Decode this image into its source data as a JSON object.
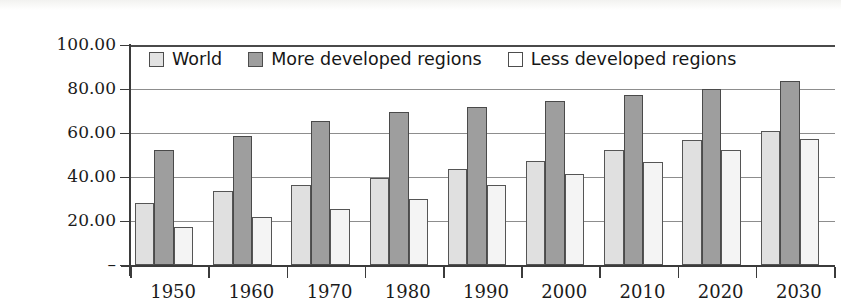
{
  "chart_data": {
    "type": "bar",
    "title": "",
    "xlabel": "",
    "ylabel": "",
    "grid": true,
    "legend_position": "top-inside",
    "ylim": [
      0,
      100
    ],
    "yticks": [
      0,
      20,
      40,
      60,
      80,
      100
    ],
    "ytick_labels": [
      "–",
      "20.00",
      "40.00",
      "60.00",
      "80.00",
      "100.00"
    ],
    "categories": [
      "1950",
      "1960",
      "1970",
      "1980",
      "1990",
      "2000",
      "2010",
      "2020",
      "2030"
    ],
    "series": [
      {
        "name": "World",
        "color": "#e0e0e0",
        "values": [
          28.0,
          33.5,
          36.5,
          39.5,
          43.5,
          47.5,
          52.5,
          57.0,
          61.0
        ]
      },
      {
        "name": "More developed regions",
        "color": "#9e9e9e",
        "values": [
          52.5,
          58.5,
          65.5,
          69.5,
          72.0,
          74.5,
          77.5,
          80.0,
          83.5
        ]
      },
      {
        "name": "Less developed regions",
        "color": "#f4f4f4",
        "values": [
          17.5,
          22.0,
          25.5,
          30.0,
          36.5,
          41.5,
          47.0,
          52.5,
          57.5
        ]
      }
    ]
  },
  "colors": {
    "series_world": "#e0e0e0",
    "series_more_developed": "#9e9e9e",
    "series_less_developed": "#f4f4f4",
    "axis": "#3b3b3b",
    "gridline": "#8d8d8d",
    "background": "#ffffff"
  }
}
